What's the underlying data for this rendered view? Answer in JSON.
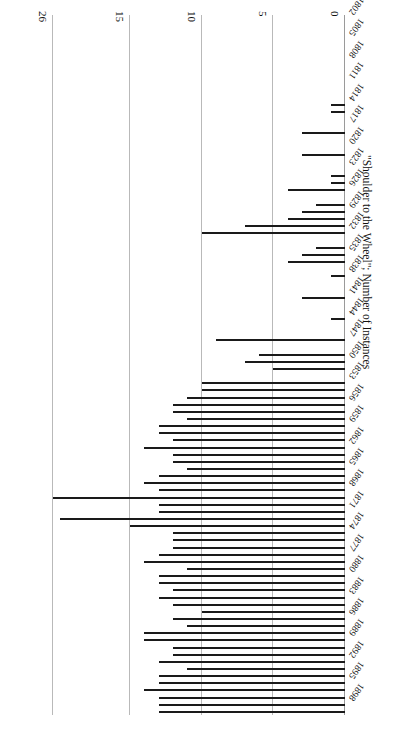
{
  "figure": {
    "orientation": "rotated-180",
    "axis_title": "\"Shoulder to the Wheel\"; Number of Instances"
  },
  "chart_data": {
    "type": "bar",
    "title": "",
    "subtitle": "",
    "xlabel": "",
    "ylabel": "\"Shoulder to the Wheel\"; Number of Instances",
    "orientation": "vertical-bars-rendered-rotated",
    "grid": true,
    "legend": null,
    "ylim": [
      0,
      26
    ],
    "yticks": [
      0,
      5,
      10,
      15,
      26
    ],
    "ytick_labels": [
      "0",
      "5",
      "10",
      "15",
      "26"
    ],
    "axis_note": "value axis is broken/compressed between 15 and 26",
    "xtick_labels": [
      "1802",
      "1805",
      "1808",
      "1811",
      "1814",
      "1817",
      "1820",
      "1823",
      "1826",
      "1829",
      "1832",
      "1835",
      "1838",
      "1841",
      "1844",
      "1847",
      "1850",
      "1853",
      "1856",
      "1859",
      "1862",
      "1865",
      "1868",
      "1871",
      "1874",
      "1877",
      "1880",
      "1883",
      "1886",
      "1889",
      "1892",
      "1895",
      "1898"
    ],
    "xtick_step": 3,
    "categories": [
      "1802",
      "1803",
      "1804",
      "1805",
      "1806",
      "1807",
      "1808",
      "1809",
      "1810",
      "1811",
      "1812",
      "1813",
      "1814",
      "1815",
      "1816",
      "1817",
      "1818",
      "1819",
      "1820",
      "1821",
      "1822",
      "1823",
      "1824",
      "1825",
      "1826",
      "1827",
      "1828",
      "1829",
      "1830",
      "1831",
      "1832",
      "1833",
      "1834",
      "1835",
      "1836",
      "1837",
      "1838",
      "1839",
      "1840",
      "1841",
      "1842",
      "1843",
      "1844",
      "1845",
      "1846",
      "1847",
      "1848",
      "1849",
      "1850",
      "1851",
      "1852",
      "1853",
      "1854",
      "1855",
      "1856",
      "1857",
      "1858",
      "1859",
      "1860",
      "1861",
      "1862",
      "1863",
      "1864",
      "1865",
      "1866",
      "1867",
      "1868",
      "1869",
      "1870",
      "1871",
      "1872",
      "1873",
      "1874",
      "1875",
      "1876",
      "1877",
      "1878",
      "1879",
      "1880",
      "1881",
      "1882",
      "1883",
      "1884",
      "1885",
      "1886",
      "1887",
      "1888",
      "1889",
      "1890",
      "1891",
      "1892",
      "1893",
      "1894",
      "1895",
      "1896",
      "1897",
      "1898",
      "1899"
    ],
    "values": [
      0,
      0,
      0,
      0,
      0,
      0,
      0,
      0,
      0,
      0,
      0,
      0,
      1,
      1,
      0,
      0,
      3,
      0,
      0,
      3,
      0,
      0,
      1,
      1,
      4,
      0,
      2,
      3,
      4,
      7,
      10,
      0,
      2,
      3,
      4,
      0,
      1,
      0,
      0,
      3,
      0,
      0,
      1,
      0,
      0,
      9,
      0,
      6,
      7,
      5,
      0,
      10,
      10,
      11,
      12,
      12,
      11,
      13,
      13,
      12,
      14,
      12,
      12,
      11,
      13,
      14,
      13,
      26,
      13,
      13,
      25,
      15,
      12,
      12,
      12,
      13,
      14,
      11,
      13,
      13,
      12,
      13,
      12,
      10,
      12,
      11,
      14,
      14,
      12,
      12,
      13,
      11,
      13,
      13,
      14,
      13,
      13,
      13
    ]
  }
}
